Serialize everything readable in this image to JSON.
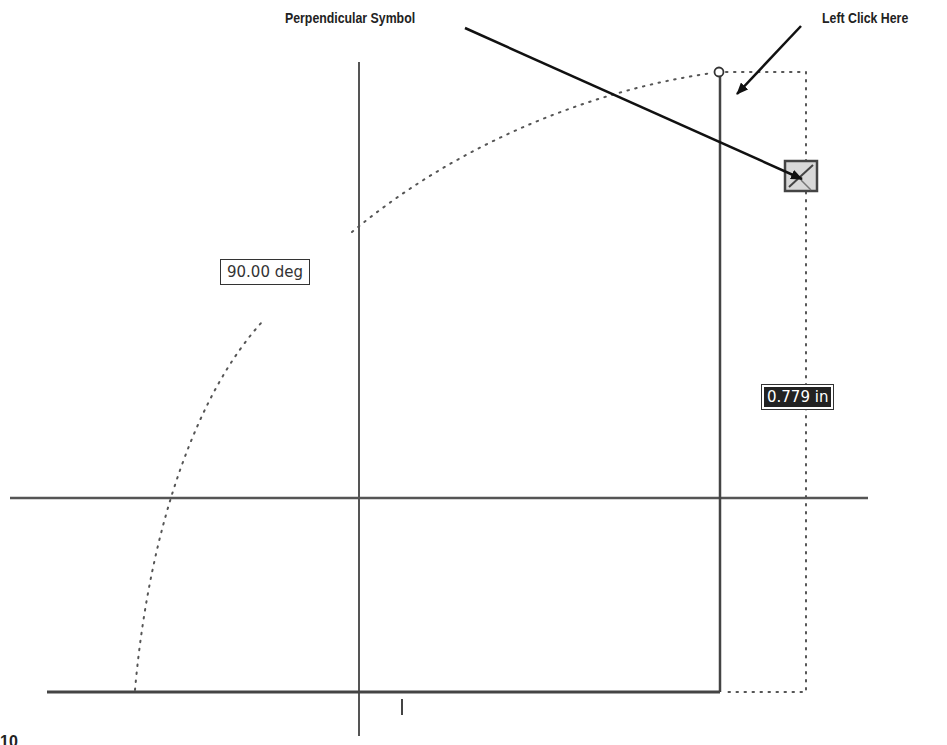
{
  "callouts": {
    "perpendicular": "Perpendicular Symbol",
    "left_click": "Left Click Here"
  },
  "dimensions": {
    "angle": "90.00 deg",
    "length": "0.779 in"
  },
  "figure_label": "10",
  "icons": {
    "pick_point": "circle-grip-icon",
    "constraint": "perpendicular-constraint-icon"
  },
  "colors": {
    "line": "#444444",
    "dotted": "#555555",
    "text": "#222222",
    "glyph_bg": "#d8d8d8",
    "length_bg": "#222222"
  }
}
